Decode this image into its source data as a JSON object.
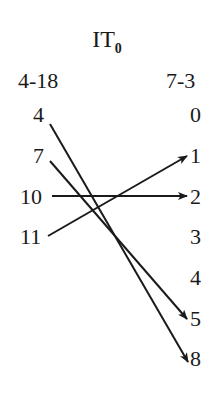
{
  "title": {
    "main": "IT",
    "subscript": "0"
  },
  "columns": {
    "left": {
      "header": "4-18",
      "items": [
        "4",
        "7",
        "10",
        "11"
      ]
    },
    "right": {
      "header": "7-3",
      "items": [
        "0",
        "1",
        "2",
        "3",
        "4",
        "5",
        "8"
      ]
    }
  },
  "arrows": [
    {
      "from": "4",
      "to": "8"
    },
    {
      "from": "7",
      "to": "5"
    },
    {
      "from": "10",
      "to": "2"
    },
    {
      "from": "11",
      "to": "1"
    }
  ],
  "colors": {
    "ink": "#1a1a1a",
    "background": "#ffffff"
  }
}
